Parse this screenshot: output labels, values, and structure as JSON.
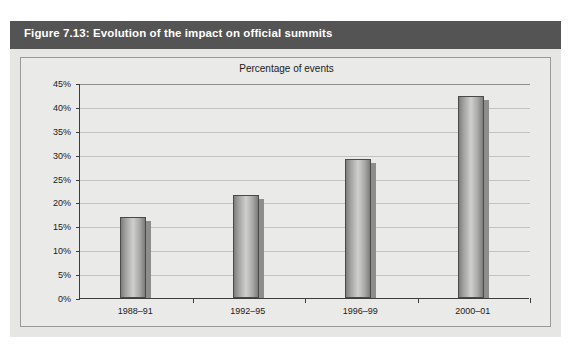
{
  "figure": {
    "header_title": "Figure 7.13: Evolution of the impact on official summits",
    "header_bg": "#545454",
    "panel_bg": "#e6e6e4"
  },
  "chart_data": {
    "type": "bar",
    "title": "Percentage of events",
    "xlabel": "",
    "ylabel": "",
    "categories": [
      "1988–91",
      "1992–95",
      "1996–99",
      "2000–01"
    ],
    "values": [
      16.9,
      21.5,
      29.2,
      42.3
    ],
    "ytick_labels": [
      "0%",
      "5%",
      "10%",
      "15%",
      "20%",
      "25%",
      "30%",
      "35%",
      "40%",
      "45%"
    ],
    "ytick_values": [
      0,
      5,
      10,
      15,
      20,
      25,
      30,
      35,
      40,
      45
    ],
    "ylim": [
      0,
      45
    ],
    "grid": true,
    "legend": null,
    "bar_color": "#b0b0ae",
    "bar_edge_color": "#4a4a4a",
    "shadow_color": "#8d8d8b",
    "gridline_color": "#c2c2c0",
    "axis_color": "#3d3d3d",
    "plot_bg": "#eaeae8"
  }
}
